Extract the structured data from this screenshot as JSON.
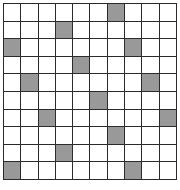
{
  "figure": {
    "title": "",
    "kind": "grid-matrix",
    "rows": 10,
    "columns": 10,
    "cell_states": {
      "empty": "white",
      "filled": "gray"
    },
    "colors": {
      "background": "#ffffff",
      "grid_line": "#2b2b2b",
      "empty_cell": "#ffffff",
      "filled_cell": "#999999"
    }
  },
  "chart_data": {
    "type": "heatmap",
    "title": "",
    "subtitle": "",
    "xlabel": "",
    "ylabel": "",
    "grid": true,
    "legend": "none",
    "categories": [
      "1",
      "2",
      "3",
      "4",
      "5",
      "6",
      "7",
      "8",
      "9",
      "10"
    ],
    "row_labels": [
      "1",
      "2",
      "3",
      "4",
      "5",
      "6",
      "7",
      "8",
      "9",
      "10"
    ],
    "value_scale": [
      0,
      1
    ],
    "filled_cells": [
      {
        "row": 1,
        "col": 7
      },
      {
        "row": 2,
        "col": 4
      },
      {
        "row": 3,
        "col": 1
      },
      {
        "row": 3,
        "col": 8
      },
      {
        "row": 4,
        "col": 5
      },
      {
        "row": 5,
        "col": 2
      },
      {
        "row": 5,
        "col": 9
      },
      {
        "row": 6,
        "col": 6
      },
      {
        "row": 7,
        "col": 3
      },
      {
        "row": 7,
        "col": 10
      },
      {
        "row": 8,
        "col": 7
      },
      {
        "row": 9,
        "col": 4
      },
      {
        "row": 10,
        "col": 1
      },
      {
        "row": 10,
        "col": 8
      }
    ],
    "filled_count": 14,
    "total_cells": 100,
    "matrix": [
      [
        0,
        0,
        0,
        0,
        0,
        0,
        1,
        0,
        0,
        0
      ],
      [
        0,
        0,
        0,
        1,
        0,
        0,
        0,
        0,
        0,
        0
      ],
      [
        1,
        0,
        0,
        0,
        0,
        0,
        0,
        1,
        0,
        0
      ],
      [
        0,
        0,
        0,
        0,
        1,
        0,
        0,
        0,
        0,
        0
      ],
      [
        0,
        1,
        0,
        0,
        0,
        0,
        0,
        0,
        1,
        0
      ],
      [
        0,
        0,
        0,
        0,
        0,
        1,
        0,
        0,
        0,
        0
      ],
      [
        0,
        0,
        1,
        0,
        0,
        0,
        0,
        0,
        0,
        1
      ],
      [
        0,
        0,
        0,
        0,
        0,
        0,
        1,
        0,
        0,
        0
      ],
      [
        0,
        0,
        0,
        1,
        0,
        0,
        0,
        0,
        0,
        0
      ],
      [
        1,
        0,
        0,
        0,
        0,
        0,
        0,
        1,
        0,
        0
      ]
    ]
  }
}
